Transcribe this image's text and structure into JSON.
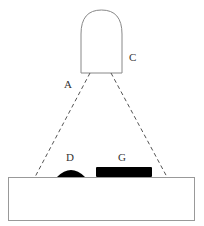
{
  "diagram": {
    "labels": {
      "A": "A",
      "C": "C",
      "D": "D",
      "G": "G"
    },
    "colors": {
      "stroke": "#777777",
      "fill_dark": "#000000",
      "background": "#ffffff"
    }
  }
}
